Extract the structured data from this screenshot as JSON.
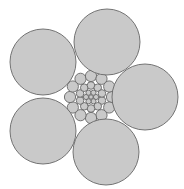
{
  "diagram": {
    "type": "circle-packing",
    "colors": {
      "background": "#ffffff",
      "fill": "#c9c9c9",
      "stroke": "#666666"
    },
    "large_circles": [
      {
        "cx": 107,
        "cy": 42,
        "r": 33
      },
      {
        "cx": 43,
        "cy": 62,
        "r": 33
      },
      {
        "cx": 145,
        "cy": 97,
        "r": 33
      },
      {
        "cx": 43,
        "cy": 131,
        "r": 33
      },
      {
        "cx": 106,
        "cy": 152,
        "r": 33
      }
    ],
    "cluster": {
      "cx": 91,
      "cy": 97,
      "rings": [
        {
          "count": 1,
          "radius": 0,
          "circle_r": 2.2,
          "offset_deg": 0
        },
        {
          "count": 6,
          "radius": 5,
          "circle_r": 2.6,
          "offset_deg": 0
        },
        {
          "count": 10,
          "radius": 11.5,
          "circle_r": 3.8,
          "offset_deg": 18
        },
        {
          "count": 12,
          "radius": 21,
          "circle_r": 5.6,
          "offset_deg": 0
        }
      ]
    }
  }
}
